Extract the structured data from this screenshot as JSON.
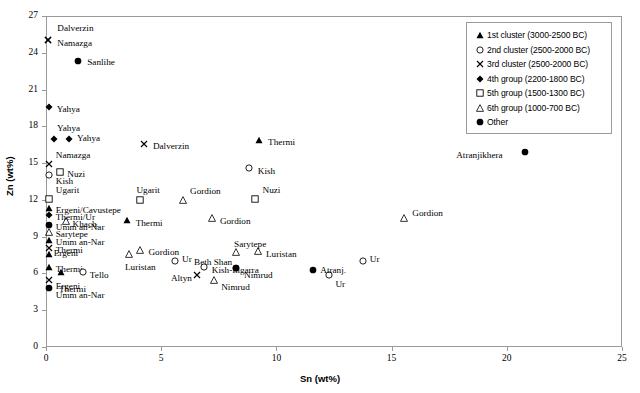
{
  "chart_data": {
    "type": "scatter",
    "title": "",
    "xlabel": "Sn (wt%)",
    "ylabel": "Zn (wt%)",
    "xlim": [
      0,
      25
    ],
    "ylim": [
      0,
      27
    ],
    "xticks": [
      0,
      5,
      10,
      15,
      20,
      25
    ],
    "yticks": [
      0,
      3,
      6,
      9,
      12,
      15,
      18,
      21,
      24,
      27
    ],
    "grid": false,
    "legend_position": "top-right",
    "series": [
      {
        "name": "1st cluster (3000-2500 BC)",
        "marker": "filled-triangle"
      },
      {
        "name": "2nd cluster (2500-2000 BC)",
        "marker": "open-circle"
      },
      {
        "name": "3rd cluster (2500-2000 BC)",
        "marker": "cross-x"
      },
      {
        "name": "4th group (2200-1800 BC)",
        "marker": "filled-diamond"
      },
      {
        "name": "5th group (1500-1300 BC)",
        "marker": "open-square"
      },
      {
        "name": "6th group (1000-700 BC)",
        "marker": "open-triangle"
      },
      {
        "name": "Other",
        "marker": "filled-circle"
      }
    ],
    "points": [
      {
        "label": "Dalverzin",
        "marker": "cross-x",
        "x": 0.1,
        "y": 25.05,
        "lx": 9,
        "ly": -16
      },
      {
        "label": "Namazga",
        "marker": "cross-x",
        "x": 0.1,
        "y": 25.05,
        "lx": 9,
        "ly": -1
      },
      {
        "label": "Sanlihe",
        "marker": "filled-circle",
        "x": 1.4,
        "y": 23.3,
        "lx": 9,
        "ly": -3
      },
      {
        "label": "Yahya",
        "marker": "filled-diamond",
        "x": 0.12,
        "y": 19.55,
        "lx": 8,
        "ly": -2
      },
      {
        "label": "Yahya",
        "marker": "filled-diamond",
        "x": 0.35,
        "y": 16.95,
        "lx": 3,
        "ly": -15
      },
      {
        "label": "Yahya",
        "marker": "filled-diamond",
        "x": 1.0,
        "y": 16.95,
        "lx": 8,
        "ly": 0
      },
      {
        "label": "Dalverzin",
        "marker": "cross-x",
        "x": 4.25,
        "y": 16.55,
        "lx": 9,
        "ly": -2
      },
      {
        "label": "Thermi",
        "marker": "filled-triangle",
        "x": 9.25,
        "y": 16.9,
        "lx": 9,
        "ly": -2
      },
      {
        "label": "Namazga",
        "marker": "cross-x",
        "x": 0.12,
        "y": 14.9,
        "lx": 7,
        "ly": -13
      },
      {
        "label": "Nuzi",
        "marker": "open-square",
        "x": 0.62,
        "y": 14.25,
        "lx": 7,
        "ly": -2
      },
      {
        "label": "Kish",
        "marker": "open-circle",
        "x": 0.12,
        "y": 14.0,
        "lx": 7,
        "ly": 2
      },
      {
        "label": "Kish",
        "marker": "open-circle",
        "x": 8.8,
        "y": 14.6,
        "lx": 9,
        "ly": -1
      },
      {
        "label": "Atranjikhera",
        "marker": "filled-circle",
        "x": 20.8,
        "y": 15.9,
        "lx": -69,
        "ly": -1
      },
      {
        "label": "Ugarit",
        "marker": "open-square",
        "x": 0.12,
        "y": 12.05,
        "lx": 7,
        "ly": -13
      },
      {
        "label": "Ugarit",
        "marker": "open-square",
        "x": 4.1,
        "y": 12.0,
        "lx": -4,
        "ly": -14
      },
      {
        "label": "Gordion",
        "marker": "open-triangle",
        "x": 5.95,
        "y": 12.0,
        "lx": 7,
        "ly": -13
      },
      {
        "label": "Nuzi",
        "marker": "open-square",
        "x": 9.05,
        "y": 12.1,
        "lx": 8,
        "ly": -13
      },
      {
        "label": "Ergeni/Cavustepe",
        "marker": "filled-triangle",
        "x": 0.12,
        "y": 11.3,
        "lx": 7,
        "ly": -2
      },
      {
        "label": "Thermi/Ur",
        "marker": "filled-diamond",
        "x": 0.12,
        "y": 10.75,
        "lx": 7,
        "ly": -2
      },
      {
        "label": "Khach.",
        "marker": "open-triangle",
        "x": 0.85,
        "y": 10.25,
        "lx": 7,
        "ly": -1
      },
      {
        "label": "Thermi",
        "marker": "filled-triangle",
        "x": 3.5,
        "y": 10.35,
        "lx": 9,
        "ly": -1
      },
      {
        "label": "Gordion",
        "marker": "open-triangle",
        "x": 7.2,
        "y": 10.55,
        "lx": 8,
        "ly": -1
      },
      {
        "label": "Gordion",
        "marker": "open-triangle",
        "x": 15.55,
        "y": 10.55,
        "lx": 8,
        "ly": -9
      },
      {
        "label": "Umm an-Nar",
        "marker": "filled-circle",
        "x": 0.12,
        "y": 9.95,
        "lx": 7,
        "ly": -2
      },
      {
        "label": "Sarytepe",
        "marker": "open-triangle",
        "x": 0.12,
        "y": 9.35,
        "lx": 7,
        "ly": -2
      },
      {
        "label": "Sarytepe",
        "marker": "open-triangle",
        "x": 8.25,
        "y": 7.75,
        "lx": -2,
        "ly": -12
      },
      {
        "label": "Umm an-Nar",
        "marker": "filled-triangle",
        "x": 0.12,
        "y": 8.7,
        "lx": 7,
        "ly": -2
      },
      {
        "label": "Gordion",
        "marker": "open-triangle",
        "x": 4.1,
        "y": 7.95,
        "lx": 8,
        "ly": -2
      },
      {
        "label": "Luristan",
        "marker": "open-triangle",
        "x": 3.6,
        "y": 7.55,
        "lx": -4,
        "ly": 9
      },
      {
        "label": "Luristan",
        "marker": "open-triangle",
        "x": 9.2,
        "y": 7.8,
        "lx": 8,
        "ly": -1
      },
      {
        "label": "Thermi",
        "marker": "cross-x",
        "x": 0.12,
        "y": 8.05,
        "lx": 7,
        "ly": -2
      },
      {
        "label": "Ergeni",
        "marker": "filled-triangle",
        "x": 0.12,
        "y": 7.6,
        "lx": 5,
        "ly": 0
      },
      {
        "label": "Ur",
        "marker": "open-circle",
        "x": 5.6,
        "y": 7.05,
        "lx": 7,
        "ly": -6
      },
      {
        "label": "Ur",
        "marker": "open-circle",
        "x": 13.75,
        "y": 7.0,
        "lx": 7,
        "ly": -6
      },
      {
        "label": "Ur",
        "marker": "open-circle",
        "x": 12.3,
        "y": 5.9,
        "lx": 6,
        "ly": 5
      },
      {
        "label": "Beth Shan",
        "marker": "filled-circle",
        "x": 8.25,
        "y": 6.45,
        "lx": -42,
        "ly": -10
      },
      {
        "label": "Kish-Ingarra",
        "marker": "open-circle",
        "x": 6.85,
        "y": 6.55,
        "lx": 8,
        "ly": -1
      },
      {
        "label": "Nimrud",
        "marker": "filled-circle",
        "x": 8.25,
        "y": 6.45,
        "lx": 8,
        "ly": 3
      },
      {
        "label": "Nimrud",
        "marker": "open-triangle",
        "x": 7.3,
        "y": 5.5,
        "lx": 7,
        "ly": 3
      },
      {
        "label": "Atranj.",
        "marker": "filled-circle",
        "x": 11.6,
        "y": 6.3,
        "lx": 7,
        "ly": -4
      },
      {
        "label": "Altyn",
        "marker": "cross-x",
        "x": 6.55,
        "y": 5.85,
        "lx": -26,
        "ly": -1
      },
      {
        "label": "Thermi",
        "marker": "filled-triangle",
        "x": 0.12,
        "y": 6.55,
        "lx": 7,
        "ly": -2
      },
      {
        "label": "Thermi",
        "marker": "filled-triangle",
        "x": 0.65,
        "y": 6.1,
        "lx": -2,
        "ly": 13
      },
      {
        "label": "Tello",
        "marker": "open-circle",
        "x": 1.6,
        "y": 6.1,
        "lx": 7,
        "ly": -1
      },
      {
        "label": "Ergeni",
        "marker": "cross-x",
        "x": 0.12,
        "y": 5.45,
        "lx": 7,
        "ly": 2
      },
      {
        "label": "Umm an-Nar",
        "marker": "filled-circle",
        "x": 0.12,
        "y": 4.85,
        "lx": 7,
        "ly": 3
      }
    ]
  }
}
